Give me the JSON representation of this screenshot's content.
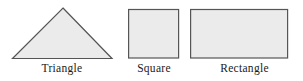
{
  "figure": {
    "background_color": "#ffffff",
    "width": 303,
    "height": 81,
    "shape_fill_color": "#ebebeb",
    "shape_stroke_color": "#555555",
    "label_color": "#1a1a1a"
  },
  "shapes": [
    {
      "name": "triangle",
      "label": "Triangle",
      "icon": "triangle-shape-icon",
      "sides": 3,
      "geometry": {
        "apex_x": 63,
        "apex_y": 8,
        "left_x": 12,
        "right_x": 112,
        "base_y": 58
      }
    },
    {
      "name": "square",
      "label": "Square",
      "icon": "square-shape-icon",
      "sides": 4,
      "geometry": {
        "x": 128,
        "y": 9,
        "width": 51,
        "height": 49
      }
    },
    {
      "name": "rectangle",
      "label": "Rectangle",
      "icon": "rectangle-shape-icon",
      "sides": 4,
      "geometry": {
        "x": 190,
        "y": 9,
        "width": 98,
        "height": 49
      }
    }
  ]
}
